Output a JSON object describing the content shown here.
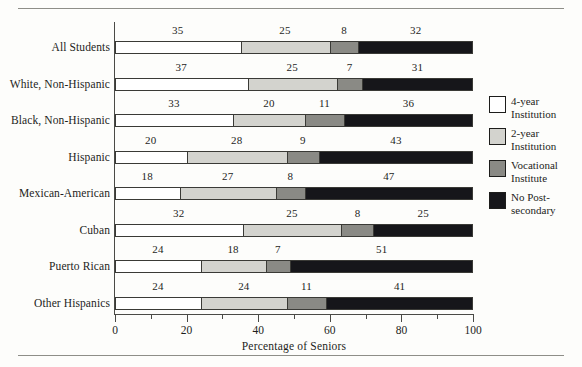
{
  "figure": {
    "xaxis_title": "Percentage of Seniors"
  },
  "legend": {
    "items": [
      {
        "label": "4-year\nInstitution",
        "color": "#ffffff",
        "icon": "legend-swatch-white"
      },
      {
        "label": "2-year\nInstitution",
        "color": "#d3d3ce",
        "icon": "legend-swatch-light-gray"
      },
      {
        "label": "Vocational\nInstitute",
        "color": "#8a8a85",
        "icon": "legend-swatch-medium-gray"
      },
      {
        "label": "No Post-\nsecondary",
        "color": "#16161a",
        "icon": "legend-swatch-black"
      }
    ]
  },
  "axis": {
    "major_ticks": [
      0,
      20,
      40,
      60,
      80,
      100
    ],
    "minor_ticks": [
      10,
      30,
      50,
      70,
      90
    ],
    "tick_labels": [
      "0",
      "20",
      "40",
      "60",
      "80",
      "100"
    ]
  },
  "chart_data": {
    "type": "bar",
    "orientation": "horizontal",
    "stacked": true,
    "title": "",
    "subtitle": "",
    "xlabel": "Percentage of Seniors",
    "ylabel": "",
    "xlim": [
      0,
      100
    ],
    "grid": false,
    "legend_position": "right",
    "categories": [
      "All Students",
      "White, Non-Hispanic",
      "Black, Non-Hispanic",
      "Hispanic",
      "Mexican-American",
      "Cuban",
      "Puerto Rican",
      "Other Hispanics"
    ],
    "series": [
      {
        "name": "4-year Institution",
        "color": "#ffffff",
        "values": [
          35,
          37,
          33,
          20,
          18,
          32,
          24,
          24
        ]
      },
      {
        "name": "2-year Institution",
        "color": "#d3d3ce",
        "values": [
          25,
          25,
          20,
          28,
          27,
          25,
          18,
          24
        ]
      },
      {
        "name": "Vocational Institute",
        "color": "#8a8a85",
        "values": [
          8,
          7,
          11,
          9,
          8,
          8,
          7,
          11
        ]
      },
      {
        "name": "No Post-secondary",
        "color": "#16161a",
        "values": [
          32,
          31,
          36,
          43,
          47,
          25,
          51,
          41
        ]
      }
    ],
    "data_labels": [
      {
        "category": "All Students",
        "labels": [
          "35",
          "25",
          "8",
          "32"
        ]
      },
      {
        "category": "White, Non-Hispanic",
        "labels": [
          "37",
          "25",
          "7",
          "31"
        ]
      },
      {
        "category": "Black, Non-Hispanic",
        "labels": [
          "33",
          "20",
          "11",
          "36"
        ]
      },
      {
        "category": "Hispanic",
        "labels": [
          "20",
          "28",
          "9",
          "43"
        ]
      },
      {
        "category": "Mexican-American",
        "labels": [
          "18",
          "27",
          "8",
          "47"
        ]
      },
      {
        "category": "Cuban",
        "labels": [
          "32",
          "25",
          "8",
          "25"
        ]
      },
      {
        "category": "Puerto Rican",
        "labels": [
          "24",
          "18",
          "7",
          "51"
        ]
      },
      {
        "category": "Other Hispanics",
        "labels": [
          "24",
          "24",
          "11",
          "41"
        ]
      }
    ]
  }
}
